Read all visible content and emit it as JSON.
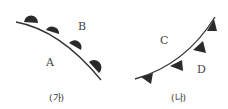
{
  "diagram_a": {
    "caption": "(가)",
    "label_upper": "B",
    "label_lower": "A",
    "front_symbol": "semicircle"
  },
  "diagram_b": {
    "caption": "(나)",
    "label_upper": "C",
    "label_lower": "D",
    "front_symbol": "triangle"
  },
  "colors": {
    "line": "#333333",
    "symbol": "#2a2a2a"
  }
}
